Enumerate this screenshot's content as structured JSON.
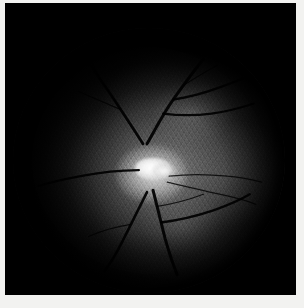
{
  "image": {
    "title": "Retinal fundus photograph",
    "modality": "Fundus photography",
    "color_mode": "Grayscale",
    "width_px": 304,
    "height_px": 308,
    "background_color": "#000000",
    "frame_color": "#f2f2f0"
  },
  "field_of_view": {
    "name": "circular-retinal-field",
    "shape": "circle",
    "center_x": 152,
    "center_y": 160,
    "diameter_px": 270,
    "rim_color": "#000000"
  },
  "optic_disc": {
    "name": "optic-disc",
    "center_x": 157,
    "center_y": 170,
    "approx_width_px": 34,
    "approx_height_px": 24,
    "brightness": "saturated-white",
    "core_color": "#ffffff",
    "halo_color": "#cfcfcf"
  },
  "anatomy": [
    {
      "label": "Optic disc",
      "region": "center"
    },
    {
      "label": "Superior temporal arcade",
      "region": "upper-right"
    },
    {
      "label": "Inferior temporal arcade",
      "region": "lower-right"
    },
    {
      "label": "Superior nasal vessels",
      "region": "upper-left"
    },
    {
      "label": "Inferior nasal vessels",
      "region": "lower-left"
    },
    {
      "label": "Peripapillary glow",
      "region": "around-disc"
    }
  ],
  "vessels": {
    "name": "retinal-vasculature",
    "stroke_color": "#000000",
    "origin": "optic-disc",
    "branch_count": 9,
    "paths": [
      {
        "id": "sup-temporal-main",
        "d": "M150,140 C158,126 166,110 176,96 C186,82 196,68 206,56"
      },
      {
        "id": "sup-temporal-b1",
        "d": "M176,96 C190,94 206,90 222,84 C236,79 248,74 258,70"
      },
      {
        "id": "sup-temporal-b2",
        "d": "M166,110 C182,112 198,112 214,110 C230,108 244,104 256,100"
      },
      {
        "id": "sup-temporal-b3",
        "d": "M186,82 C196,76 208,68 220,62"
      },
      {
        "id": "sup-nasal-main",
        "d": "M146,140 C136,124 124,106 112,88 C102,74 94,62 88,52"
      },
      {
        "id": "sup-nasal-b1",
        "d": "M124,106 C110,100 96,94 82,88"
      },
      {
        "id": "sup-nasal-b2",
        "d": "M112,88 C104,78 98,66 94,54"
      },
      {
        "id": "nasal-horizontal",
        "d": "M142,166 C124,166 104,168 84,172 C68,175 54,178 42,182"
      },
      {
        "id": "inf-temporal-main",
        "d": "M156,186 C160,202 164,218 168,234 C172,248 176,260 180,270"
      },
      {
        "id": "inf-temporal-b1",
        "d": "M164,218 C180,216 198,212 216,206 C230,201 242,196 252,190"
      },
      {
        "id": "inf-temporal-b2",
        "d": "M160,202 C174,200 190,196 206,190"
      },
      {
        "id": "inf-nasal-main",
        "d": "M150,188 C142,204 134,220 126,236 C120,248 114,258 108,266"
      },
      {
        "id": "temporal-thin-1",
        "d": "M172,172 C190,170 210,170 230,172 C244,173 256,176 264,178"
      },
      {
        "id": "temporal-thin-2",
        "d": "M170,178 C186,182 204,186 222,190 C236,193 248,196 258,200"
      },
      {
        "id": "inf-nasal-b1",
        "d": "M134,220 C120,222 106,226 92,232"
      }
    ]
  },
  "texture": {
    "name": "weave-artifact",
    "description": "Diagonal cross-hatch compression/mesh pattern across the retina",
    "primary_angle_deg": 58,
    "secondary_angle_deg": -54
  },
  "tone": {
    "brightest_value": 255,
    "retina_mid_value": 96,
    "periphery_value": 10,
    "vignette": "strong"
  }
}
